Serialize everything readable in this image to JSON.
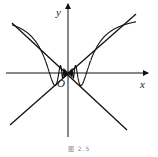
{
  "figure": {
    "caption": "图 2.5",
    "axes": {
      "x_label": "x",
      "y_label": "y",
      "origin_label": "O",
      "origin_px": [
        68,
        73
      ],
      "x_axis": {
        "from": [
          6,
          73
        ],
        "to": [
          148,
          73
        ]
      },
      "y_axis": {
        "from": [
          68,
          137
        ],
        "to": [
          68,
          4
        ]
      }
    },
    "bounding_lines": [
      {
        "name": "y = x",
        "from": [
          10,
          125
        ],
        "to": [
          136,
          14
        ]
      },
      {
        "name": "y = -x",
        "from": [
          12,
          23
        ],
        "to": [
          127,
          130
        ]
      }
    ],
    "curve": {
      "function": "y = x sin(1/x)",
      "color": "#111111",
      "x_range_px": [
        12,
        136
      ],
      "scale_px_per_unit": 58
    },
    "colors": {
      "stroke": "#111111",
      "background": "#ffffff"
    }
  }
}
